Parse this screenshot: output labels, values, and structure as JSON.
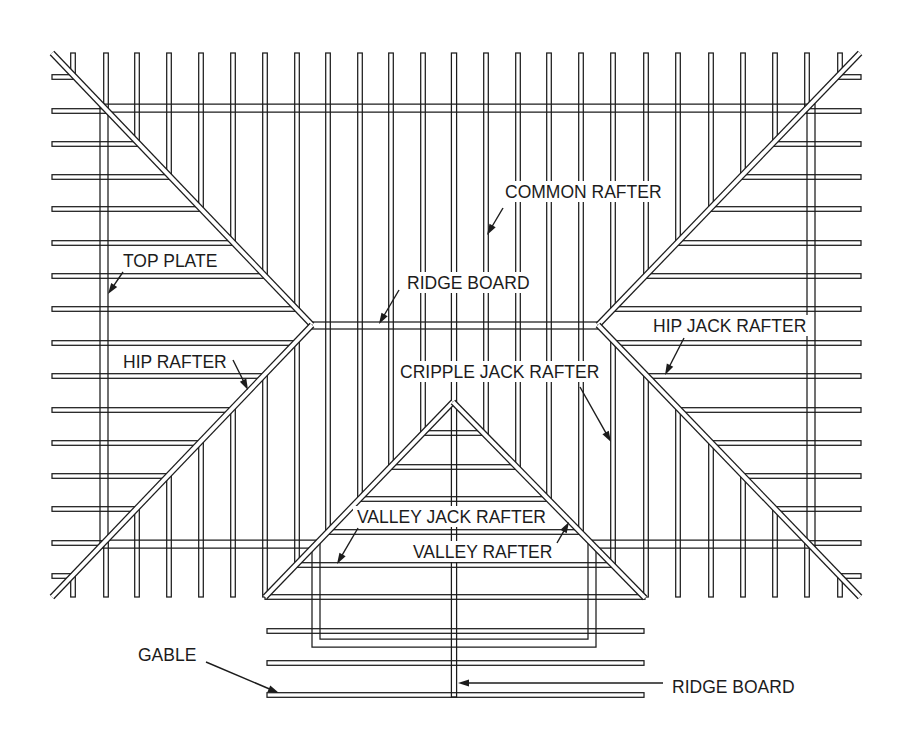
{
  "labels": [
    {
      "id": "common-rafter",
      "text": "COMMON RAFTER",
      "x": 505,
      "y": 198,
      "arrow": [
        503,
        208,
        487,
        235
      ]
    },
    {
      "id": "top-plate",
      "text": "TOP PLATE",
      "x": 123,
      "y": 267,
      "arrow": [
        123,
        272,
        108,
        294
      ]
    },
    {
      "id": "ridge-board-top",
      "text": "RIDGE BOARD",
      "x": 407,
      "y": 289,
      "arrow": [
        399,
        290,
        379,
        324
      ]
    },
    {
      "id": "hip-jack-rafter",
      "text": "HIP JACK RAFTER",
      "x": 653,
      "y": 332,
      "arrow": [
        684,
        338,
        665,
        375
      ]
    },
    {
      "id": "hip-rafter",
      "text": "HIP RAFTER",
      "x": 123,
      "y": 368,
      "arrow": [
        233,
        360,
        248,
        390
      ]
    },
    {
      "id": "cripple-jack-rafter",
      "text": "CRIPPLE JACK RAFTER",
      "x": 400,
      "y": 378,
      "arrow": [
        580,
        387,
        611,
        442
      ]
    },
    {
      "id": "valley-jack-rafter",
      "text": "VALLEY JACK RAFTER",
      "x": 357,
      "y": 523,
      "arrow": [
        358,
        528,
        337,
        564
      ]
    },
    {
      "id": "valley-rafter",
      "text": "VALLEY RAFTER",
      "x": 413,
      "y": 558,
      "arrow": [
        557,
        543,
        569,
        522
      ]
    },
    {
      "id": "gable",
      "text": "GABLE",
      "x": 138,
      "y": 661,
      "arrow": [
        206,
        662,
        279,
        693
      ]
    },
    {
      "id": "ridge-board-bottom",
      "text": "RIDGE BOARD",
      "x": 672,
      "y": 693,
      "arrow": [
        663,
        683,
        458,
        683
      ]
    }
  ],
  "framing": {
    "member_half_width": 2.3,
    "rafter_top_y": 53,
    "rafter_bottom_y": 597,
    "rafter_left_x": 52,
    "rafter_right_x": 861,
    "common_rafters_x": [
      73,
      106,
      137,
      169,
      201,
      233,
      265,
      297,
      328,
      360,
      391,
      423,
      454,
      486,
      518,
      549,
      581,
      613,
      646,
      678,
      711,
      743,
      775,
      807,
      840
    ],
    "horizontal_rafters_y": [
      77,
      111,
      144,
      177,
      209,
      243,
      276,
      309,
      343,
      376,
      410,
      443,
      476,
      509,
      543,
      576
    ],
    "gable_ridge": {
      "x": 454,
      "y1": 53,
      "y2": 697
    },
    "ridge_board": {
      "x1": 312,
      "x2": 598,
      "y1": 322,
      "y2": 329
    },
    "hip_rafters": {
      "upper_left": [
        52,
        53,
        312,
        325
      ],
      "lower_left": [
        312,
        325,
        52,
        597
      ],
      "upper_right": [
        860,
        53,
        598,
        325
      ],
      "lower_right": [
        598,
        325,
        860,
        597
      ]
    },
    "valley_rafters": {
      "left": [
        453,
        402,
        265,
        597
      ],
      "right": [
        453,
        402,
        645,
        598
      ]
    },
    "valley_jack_rafters_y": [
      433,
      467,
      499,
      532,
      565
    ],
    "gable_base": {
      "y": 597,
      "x1": 265,
      "x2": 645
    },
    "gable_rafters": {
      "y": [
        631,
        663,
        695
      ],
      "x1": 267,
      "x2": 644
    },
    "top_plate": {
      "outer": [
        [
          100,
          104
        ],
        [
          815,
          104
        ],
        [
          815,
          548
        ],
        [
          596,
          548
        ],
        [
          596,
          647
        ],
        [
          312,
          647
        ],
        [
          312,
          548
        ],
        [
          100,
          548
        ]
      ],
      "inner": [
        [
          108,
          112
        ],
        [
          807,
          112
        ],
        [
          807,
          540
        ],
        [
          588,
          540
        ],
        [
          588,
          639
        ],
        [
          320,
          639
        ],
        [
          320,
          540
        ],
        [
          108,
          540
        ]
      ]
    }
  }
}
